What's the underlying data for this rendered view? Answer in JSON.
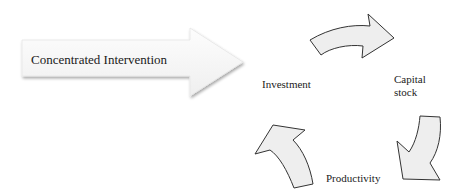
{
  "diagram": {
    "intervention_arrow": {
      "label": "Concentrated Intervention",
      "fill": "#f7f7f7",
      "shadow": "#d9d9d9"
    },
    "cycle": {
      "nodes": [
        {
          "id": "investment",
          "label": "Investment"
        },
        {
          "id": "capital_stock",
          "label": "Capital stock",
          "lines": [
            "Capital",
            "stock"
          ]
        },
        {
          "id": "productivity",
          "label": "Productivity"
        }
      ],
      "edges": [
        {
          "from": "investment",
          "to": "capital_stock"
        },
        {
          "from": "capital_stock",
          "to": "productivity"
        },
        {
          "from": "productivity",
          "to": "investment"
        }
      ],
      "arrow_fill": "#eeeeee",
      "arrow_stroke": "#333333"
    }
  }
}
